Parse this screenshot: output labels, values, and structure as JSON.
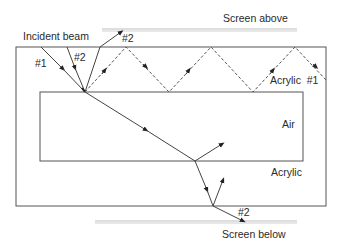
{
  "labels": {
    "incident_beam": "Incident beam",
    "ray1": "#1",
    "ray2_incident": "#2",
    "ray2_reflected_top": "#2",
    "acrylic_top": "Acrylic  #1",
    "air": "Air",
    "acrylic_bottom": "Acrylic",
    "ray2_exit_bottom": "#2",
    "screen_above": "Screen above",
    "screen_below": "Screen below"
  },
  "colors": {
    "line": "#555555",
    "screen": "#bdbdbd",
    "text": "#2a2a2a"
  }
}
